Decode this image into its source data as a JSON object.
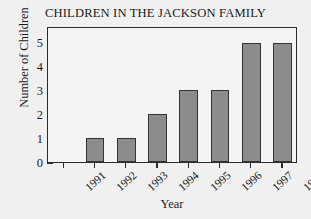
{
  "chart_data": {
    "type": "bar",
    "title": "CHILDREN IN THE JACKSON FAMILY",
    "xlabel": "Year",
    "ylabel": "Number of Children",
    "categories": [
      "1991",
      "1992",
      "1993",
      "1994",
      "1995",
      "1996",
      "1997",
      "1998"
    ],
    "values": [
      0,
      1,
      1,
      2,
      3,
      3,
      5,
      5
    ],
    "ylim": [
      0,
      5.7
    ],
    "yticks": [
      0,
      1,
      2,
      3,
      4,
      5
    ],
    "ytick_labels": [
      "0",
      "1",
      "2",
      "3",
      "4",
      "5"
    ],
    "grid": false,
    "legend": null,
    "bar_color": "#8c8c8c",
    "bar_edge_color": "#333333",
    "axis_color": "#2b2b2b",
    "plot_background": "#f4f4f4",
    "figure_background": "#f0f0f0",
    "xtick_label_rotation": -42
  }
}
